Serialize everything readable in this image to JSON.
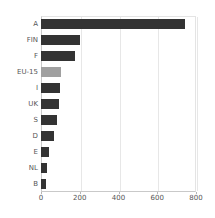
{
  "chart_data": {
    "type": "bar",
    "orientation": "horizontal",
    "title": "",
    "subtitle": "",
    "xlabel": "",
    "ylabel": "",
    "categories": [
      "A",
      "FIN",
      "F",
      "EU-15",
      "I",
      "UK",
      "S",
      "D",
      "E",
      "NL",
      "B"
    ],
    "values": [
      742,
      200,
      175,
      105,
      98,
      95,
      80,
      67,
      42,
      32,
      28
    ],
    "xlim": [
      0,
      800
    ],
    "xticks": [
      0,
      200,
      400,
      600,
      800
    ],
    "xtick_labels": [
      "0",
      "200",
      "400",
      "600",
      "800"
    ],
    "grid": "vertical",
    "legend": "none",
    "bar_color": "#333333",
    "highlight_color": "#a0a0a0",
    "highlight_categories": [
      "EU-15"
    ],
    "background_color": "#ffffff",
    "axis_color": "#c9c9c9",
    "gridline_color": "#e7e7e7",
    "tick_label_color": "#555555"
  }
}
